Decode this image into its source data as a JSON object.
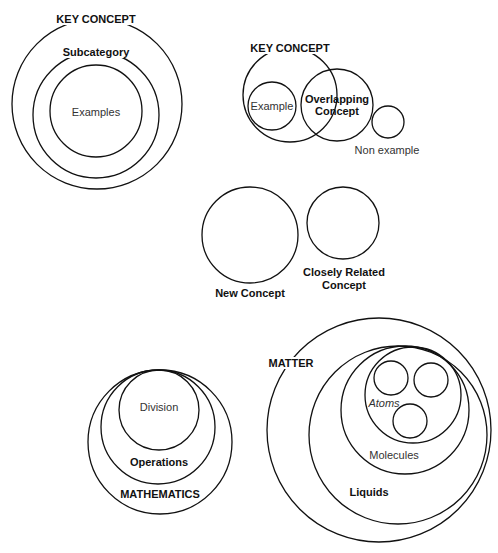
{
  "diagrams": [
    {
      "name": "concept-hierarchy",
      "circles": [
        {
          "cx": 97,
          "cy": 104,
          "r": 85
        },
        {
          "cx": 96,
          "cy": 115,
          "r": 63
        },
        {
          "cx": 96,
          "cy": 111,
          "r": 46
        }
      ],
      "labels": [
        {
          "text": "KEY CONCEPT",
          "x": 96,
          "y": 19,
          "style": "bold"
        },
        {
          "text": "Subcategory",
          "x": 96,
          "y": 52,
          "style": "bold"
        },
        {
          "text": "Examples",
          "x": 96,
          "y": 112,
          "style": "regular nobg"
        }
      ]
    },
    {
      "name": "overlapping-concept",
      "circles": [
        {
          "cx": 290,
          "cy": 95,
          "r": 47
        },
        {
          "cx": 272,
          "cy": 106,
          "r": 24
        },
        {
          "cx": 337,
          "cy": 105,
          "r": 36
        },
        {
          "cx": 388,
          "cy": 122,
          "r": 16
        }
      ],
      "labels": [
        {
          "text": "KEY CONCEPT",
          "x": 290,
          "y": 48,
          "style": "bold"
        },
        {
          "text": "Example",
          "x": 272,
          "y": 106,
          "style": "regular nobg"
        },
        {
          "text": "Overlapping",
          "x": 337,
          "y": 99,
          "style": "bold nobg"
        },
        {
          "text": "Concept",
          "x": 337,
          "y": 111,
          "style": "bold nobg"
        },
        {
          "text": "Non example",
          "x": 387,
          "y": 150,
          "style": "regular nobg"
        }
      ]
    },
    {
      "name": "new-and-related-concept",
      "circles": [
        {
          "cx": 250,
          "cy": 235,
          "r": 48
        },
        {
          "cx": 343,
          "cy": 223,
          "r": 36
        }
      ],
      "labels": [
        {
          "text": "New Concept",
          "x": 250,
          "y": 293,
          "style": "bold nobg"
        },
        {
          "text": "Closely Related",
          "x": 344,
          "y": 272,
          "style": "bold nobg"
        },
        {
          "text": "Concept",
          "x": 344,
          "y": 285,
          "style": "bold nobg"
        }
      ]
    },
    {
      "name": "mathematics",
      "circles": [
        {
          "cx": 160,
          "cy": 442,
          "r": 72
        },
        {
          "cx": 158,
          "cy": 427,
          "r": 57
        },
        {
          "cx": 159,
          "cy": 410,
          "r": 40
        }
      ],
      "labels": [
        {
          "text": "Division",
          "x": 159,
          "y": 407,
          "style": "regular nobg"
        },
        {
          "text": "Operations",
          "x": 159,
          "y": 462,
          "style": "bold nobg"
        },
        {
          "text": "MATHEMATICS",
          "x": 160,
          "y": 494,
          "style": "bold nobg"
        }
      ]
    },
    {
      "name": "matter",
      "circles": [
        {
          "cx": 379,
          "cy": 430,
          "r": 112
        },
        {
          "cx": 398,
          "cy": 435,
          "r": 89
        },
        {
          "cx": 405,
          "cy": 410,
          "r": 64
        },
        {
          "cx": 413,
          "cy": 395,
          "r": 48
        },
        {
          "cx": 391,
          "cy": 378,
          "r": 17
        },
        {
          "cx": 431,
          "cy": 380,
          "r": 17
        },
        {
          "cx": 410,
          "cy": 421,
          "r": 17
        }
      ],
      "labels": [
        {
          "text": "MATTER",
          "x": 291,
          "y": 363,
          "style": "bold"
        },
        {
          "text": "Atoms",
          "x": 384,
          "y": 403,
          "style": "regular italic nobg"
        },
        {
          "text": "Molecules",
          "x": 394,
          "y": 455,
          "style": "regular nobg"
        },
        {
          "text": "Liquids",
          "x": 369,
          "y": 492,
          "style": "bold nobg"
        }
      ]
    }
  ],
  "stroke_color": "#111111"
}
